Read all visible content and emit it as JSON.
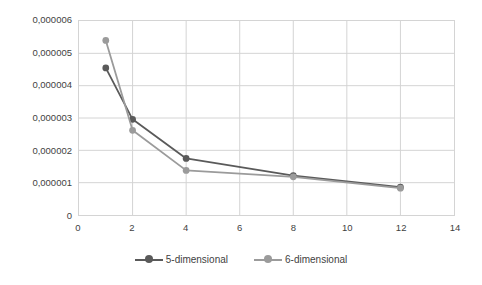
{
  "chart_data": {
    "type": "line",
    "title": "",
    "xlabel": "",
    "ylabel": "",
    "xlim": [
      0,
      14
    ],
    "ylim": [
      0,
      6e-06
    ],
    "grid": true,
    "legend_position": "bottom",
    "x": [
      1,
      2,
      4,
      8,
      12
    ],
    "x_ticks": [
      0,
      2,
      4,
      6,
      8,
      10,
      12,
      14
    ],
    "x_tick_labels": [
      "0",
      "2",
      "4",
      "6",
      "8",
      "10",
      "12",
      "14"
    ],
    "y_ticks": [
      0,
      1e-06,
      2e-06,
      3e-06,
      4e-06,
      5e-06,
      6e-06
    ],
    "y_tick_labels": [
      "0",
      "0,000001",
      "0,000002",
      "0,000003",
      "0,000004",
      "0,000005",
      "0,000006"
    ],
    "series": [
      {
        "name": "5-dimensional",
        "color": "#5a5a5a",
        "values": [
          4.55e-06,
          2.96e-06,
          1.75e-06,
          1.22e-06,
          8.6e-07
        ]
      },
      {
        "name": "6-dimensional",
        "color": "#9b9b9b",
        "values": [
          5.4e-06,
          2.62e-06,
          1.38e-06,
          1.18e-06,
          8.3e-07
        ]
      }
    ]
  },
  "legend": {
    "items": [
      {
        "label": "5-dimensional",
        "color": "#5a5a5a"
      },
      {
        "label": "6-dimensional",
        "color": "#9b9b9b"
      }
    ]
  },
  "colors": {
    "series_1": "#5a5a5a",
    "series_2": "#9b9b9b",
    "grid": "#d4d4d4",
    "text": "#3f3f3f",
    "background": "#ffffff"
  }
}
